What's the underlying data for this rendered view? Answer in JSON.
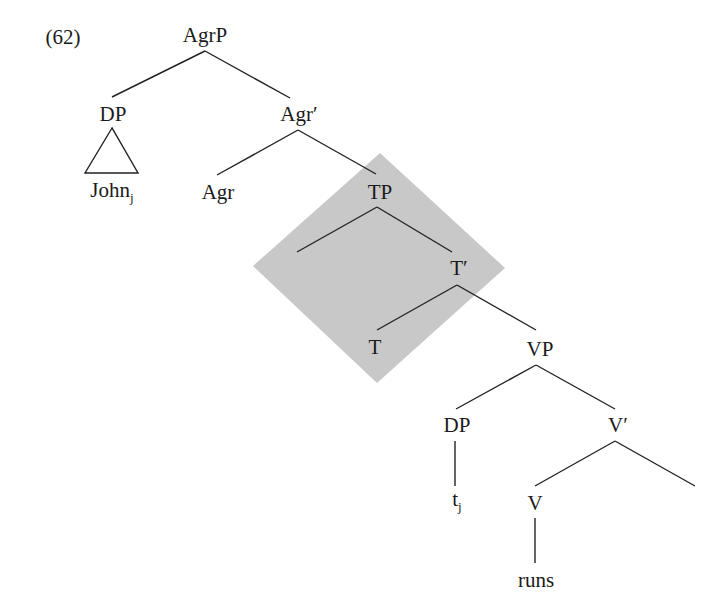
{
  "example_number": "(62)",
  "colors": {
    "highlight": "#c8c8c8",
    "line": "#222222",
    "text": "#1a1a1a"
  },
  "highlight_region": {
    "shape": "diamond",
    "points": [
      [
        380,
        153
      ],
      [
        505,
        268
      ],
      [
        377,
        383
      ],
      [
        253,
        266
      ]
    ]
  },
  "nodes": [
    {
      "id": "AgrP",
      "text": "AgrP",
      "x": 205,
      "y": 35
    },
    {
      "id": "DP1",
      "text": "DP",
      "x": 113,
      "y": 114
    },
    {
      "id": "AgrBar",
      "text": "Agr′",
      "x": 299,
      "y": 114
    },
    {
      "id": "John",
      "text": "John",
      "sub": "j",
      "x": 112,
      "y": 192
    },
    {
      "id": "Agr",
      "text": "Agr",
      "x": 218,
      "y": 192
    },
    {
      "id": "TP",
      "text": "TP",
      "x": 380,
      "y": 192
    },
    {
      "id": "TBar",
      "text": "T′",
      "x": 459,
      "y": 268
    },
    {
      "id": "T",
      "text": "T",
      "x": 375,
      "y": 347
    },
    {
      "id": "VP",
      "text": "VP",
      "x": 540,
      "y": 349
    },
    {
      "id": "DP2",
      "text": "DP",
      "x": 457,
      "y": 425
    },
    {
      "id": "VBar",
      "text": "V′",
      "x": 618,
      "y": 425
    },
    {
      "id": "trace",
      "text": "t",
      "sub": "j",
      "x": 457,
      "y": 501
    },
    {
      "id": "V",
      "text": "V",
      "x": 535,
      "y": 503
    },
    {
      "id": "runs",
      "text": "runs",
      "x": 536,
      "y": 580
    }
  ],
  "edges": [
    [
      205,
      51,
      112,
      97
    ],
    [
      205,
      51,
      290,
      98
    ],
    [
      298,
      130,
      217,
      175
    ],
    [
      298,
      130,
      376,
      174
    ],
    [
      377,
      207,
      297,
      252
    ],
    [
      377,
      207,
      452,
      252
    ],
    [
      457,
      285,
      377,
      330
    ],
    [
      457,
      285,
      536,
      330
    ],
    [
      536,
      365,
      456,
      409
    ],
    [
      536,
      365,
      615,
      409
    ],
    [
      455,
      441,
      455,
      486
    ],
    [
      615,
      441,
      535,
      486
    ],
    [
      615,
      441,
      695,
      486
    ],
    [
      535,
      518,
      535,
      563
    ]
  ],
  "triangle": {
    "apex": [
      112,
      128
    ],
    "left": [
      85,
      173
    ],
    "right": [
      138,
      173
    ]
  }
}
